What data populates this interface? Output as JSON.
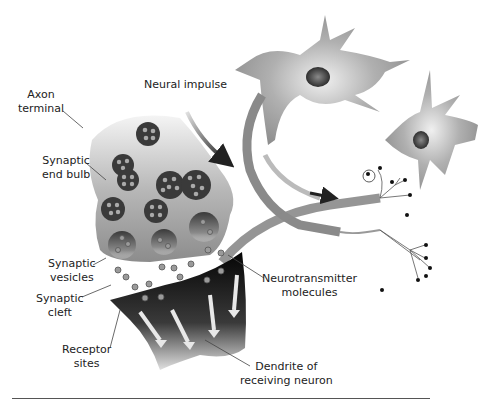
{
  "figure": {
    "type": "diagram",
    "labels": {
      "axon_terminal": [
        "Axon",
        "terminal"
      ],
      "neural_impulse": "Neural impulse",
      "synaptic_end_bulb": [
        "Synaptic",
        "end bulb"
      ],
      "synaptic_vesicles": [
        "Synaptic",
        "vesicles"
      ],
      "synaptic_cleft": [
        "Synaptic",
        "cleft"
      ],
      "receptor_sites": [
        "Receptor",
        "sites"
      ],
      "neurotransmitter_molecules": [
        "Neurotransmitter",
        "molecules"
      ],
      "dendrite": [
        "Dendrite of",
        "receiving neuron"
      ]
    },
    "caption_partial": "",
    "colors": {
      "bulb_light": "#e6e6e6",
      "bulb_dark": "#8a8a8a",
      "vesicle": "#3a3a3a",
      "molecule": "#9a9a9a",
      "dendrite": "#111111",
      "arrow": "#e8e8e8",
      "neuron": "#9c9c9c",
      "nucleus": "#4a4a4a",
      "impulse_arrow": "#333333"
    }
  }
}
